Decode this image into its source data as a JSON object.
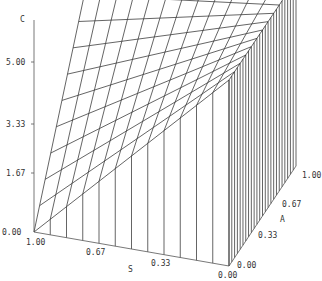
{
  "chart_data": {
    "type": "surface3d",
    "title": "",
    "axes": {
      "z": {
        "label": "C",
        "ticks": [
          "0.00",
          "1.67",
          "3.33",
          "5.00"
        ],
        "range": [
          0,
          5.0
        ]
      },
      "x": {
        "label": "S",
        "ticks": [
          "1.00",
          "0.67",
          "0.33",
          "0.00"
        ],
        "range": [
          1.0,
          0.0
        ]
      },
      "y": {
        "label": "A",
        "ticks": [
          "0.00",
          "0.33",
          "0.67",
          "1.00"
        ],
        "range": [
          0.0,
          1.0
        ]
      }
    },
    "grid": {
      "s_steps": 12,
      "a_steps": 12
    },
    "projection": {
      "origin_px": [
        34,
        232
      ],
      "s_unit_px": [
        195,
        34
      ],
      "a_unit_px": [
        67,
        -100
      ],
      "c_unit_px": [
        0,
        -37.2
      ]
    },
    "corners": {
      "S1_A0": 0.0,
      "S1_A1": 5.8,
      "S0_A0": 5.0,
      "S0_A1": 5.0
    },
    "line_color": "#222222",
    "axis_color": "#555555"
  }
}
